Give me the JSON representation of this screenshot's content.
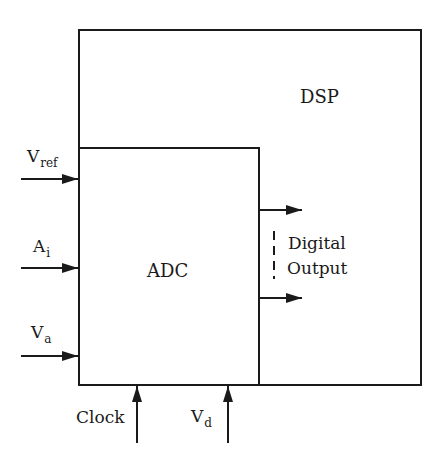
{
  "blocks": {
    "dsp": {
      "label": "DSP"
    },
    "adc": {
      "label": "ADC"
    }
  },
  "inputs": [
    {
      "main": "V",
      "sub": "ref"
    },
    {
      "main": "A",
      "sub": "i"
    },
    {
      "main": "V",
      "sub": "a"
    }
  ],
  "bottom_inputs": [
    {
      "main": "Clock",
      "sub": ""
    },
    {
      "main": "V",
      "sub": "d"
    }
  ],
  "output": {
    "line1": "Digital",
    "line2": "Output"
  },
  "colors": {
    "stroke": "#1a1a1a",
    "background": "#ffffff"
  }
}
